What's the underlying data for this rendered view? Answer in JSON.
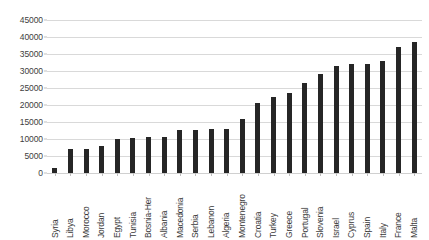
{
  "chart_data": {
    "type": "bar",
    "title": "",
    "xlabel": "",
    "ylabel": "",
    "ylim": [
      0,
      45000
    ],
    "ytick_step": 5000,
    "yticks": [
      45000,
      40000,
      35000,
      30000,
      25000,
      20000,
      15000,
      10000,
      5000,
      0
    ],
    "ytick_labels": [
      "45000",
      "40000",
      "35000",
      "30000",
      "25000",
      "20000",
      "15000",
      "10000",
      "5000",
      "0"
    ],
    "grid": true,
    "legend": false,
    "bar_color": "#262626",
    "gridline_color": "#d9d9d9",
    "categories": [
      "Syria",
      "Libya",
      "Morocco",
      "Jordan",
      "Egypt",
      "Tunisia",
      "Bosnia-Her",
      "Albania",
      "Macedonia",
      "Serbia",
      "Lebanon",
      "Algeria",
      "Montenegro",
      "Croatia",
      "Turkey",
      "Greece",
      "Portugal",
      "Slovenia",
      "Israel",
      "Cyprus",
      "Spain",
      "Italy",
      "France",
      "Malta"
    ],
    "values": [
      1500,
      7000,
      7100,
      8000,
      9900,
      10300,
      10700,
      10700,
      12700,
      12700,
      12900,
      12900,
      16000,
      20500,
      22500,
      23500,
      26500,
      29000,
      31500,
      32000,
      32000,
      33000,
      37000,
      38500
    ]
  }
}
